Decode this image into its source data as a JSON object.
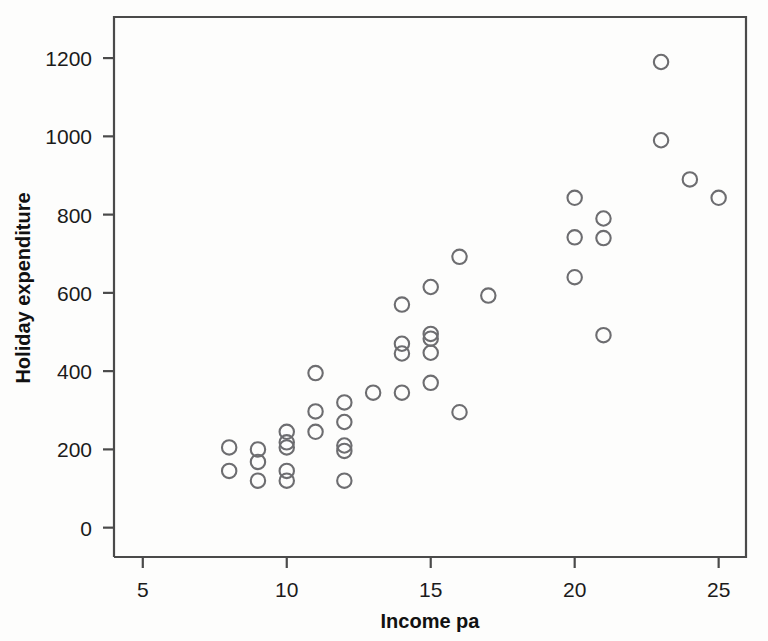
{
  "chart_data": {
    "type": "scatter",
    "title": "",
    "xlabel": "Income pa",
    "ylabel": "Holiday expenditure",
    "xlim": [
      4.0,
      25.95
    ],
    "ylim": [
      -75,
      1305
    ],
    "xticks": [
      5,
      10,
      15,
      20,
      25
    ],
    "xticklabels": [
      "5",
      "10",
      "15",
      "20",
      "25"
    ],
    "yticks": [
      0,
      200,
      400,
      600,
      800,
      1000,
      1200
    ],
    "yticklabels": [
      "0",
      "200",
      "400",
      "600",
      "800",
      "1000",
      "1200"
    ],
    "grid": false,
    "legend": null,
    "marker": "open-circle",
    "marker_color": "#6d6d70",
    "points": [
      {
        "x": 8,
        "y": 205
      },
      {
        "x": 8,
        "y": 145
      },
      {
        "x": 9,
        "y": 200
      },
      {
        "x": 9,
        "y": 168
      },
      {
        "x": 9,
        "y": 120
      },
      {
        "x": 10,
        "y": 245
      },
      {
        "x": 10,
        "y": 218
      },
      {
        "x": 10,
        "y": 205
      },
      {
        "x": 10,
        "y": 145
      },
      {
        "x": 10,
        "y": 120
      },
      {
        "x": 11,
        "y": 395
      },
      {
        "x": 11,
        "y": 297
      },
      {
        "x": 11,
        "y": 245
      },
      {
        "x": 12,
        "y": 320
      },
      {
        "x": 12,
        "y": 270
      },
      {
        "x": 12,
        "y": 210
      },
      {
        "x": 12,
        "y": 196
      },
      {
        "x": 12,
        "y": 120
      },
      {
        "x": 13,
        "y": 345
      },
      {
        "x": 14,
        "y": 570
      },
      {
        "x": 14,
        "y": 470
      },
      {
        "x": 14,
        "y": 445
      },
      {
        "x": 14,
        "y": 345
      },
      {
        "x": 15,
        "y": 615
      },
      {
        "x": 15,
        "y": 495
      },
      {
        "x": 15,
        "y": 483
      },
      {
        "x": 15,
        "y": 447
      },
      {
        "x": 15,
        "y": 370
      },
      {
        "x": 16,
        "y": 692
      },
      {
        "x": 16,
        "y": 295
      },
      {
        "x": 17,
        "y": 593
      },
      {
        "x": 20,
        "y": 843
      },
      {
        "x": 20,
        "y": 742
      },
      {
        "x": 20,
        "y": 640
      },
      {
        "x": 21,
        "y": 790
      },
      {
        "x": 21,
        "y": 740
      },
      {
        "x": 21,
        "y": 492
      },
      {
        "x": 23,
        "y": 1190
      },
      {
        "x": 23,
        "y": 990
      },
      {
        "x": 24,
        "y": 890
      },
      {
        "x": 25,
        "y": 843
      }
    ]
  }
}
